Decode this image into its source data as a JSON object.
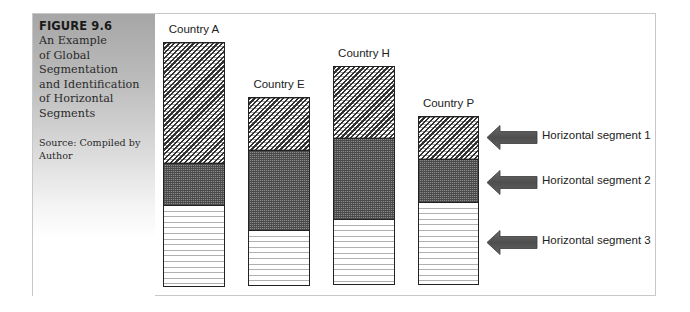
{
  "figure": {
    "number": "FIGURE 9.6",
    "title_lines": [
      "An Example",
      "of Global",
      "Segmentation",
      "and Identification",
      "of Horizontal",
      "Segments"
    ],
    "source_lines": [
      "Source: Compiled by",
      "Author"
    ]
  },
  "colors": {
    "sidebar_top": "#a6a6a6",
    "segment_1_pattern": "#2f2f2f",
    "segment_2_fill": "#6e6e6e",
    "segment_3_lines": "#b0b0b0",
    "arrow_fill": "#5a5a5a",
    "frame_border": "#c8c8c8"
  },
  "chart_data": {
    "type": "bar",
    "stacked": true,
    "title": "An Example of Global Segmentation and Identification of Horizontal Segments",
    "xlabel": "",
    "ylabel": "",
    "categories": [
      "Country A",
      "Country E",
      "Country H",
      "Country P"
    ],
    "series": [
      {
        "name": "Horizontal segment 3",
        "pattern": "horizontal-lines",
        "values": [
          80,
          54,
          64,
          82
        ]
      },
      {
        "name": "Horizontal segment 2",
        "pattern": "dense-dots",
        "values": [
          43,
          81,
          82,
          43
        ]
      },
      {
        "name": "Horizontal segment 1",
        "pattern": "diagonal-zigzag",
        "values": [
          122,
          54,
          73,
          44
        ]
      }
    ],
    "totals": [
      245,
      189,
      219,
      169
    ],
    "units": "relative pixel height (no axis shown)",
    "grid": false,
    "axes_visible": false,
    "legend": {
      "position": "right",
      "style": "left-pointing arrows",
      "entries": [
        "Horizontal segment 1",
        "Horizontal segment 2",
        "Horizontal segment 3"
      ]
    }
  },
  "bars": [
    {
      "label": "Country A",
      "left": 163,
      "top": 42,
      "width": 62,
      "bottom": 287,
      "s1": 122,
      "s2": 43,
      "s3": 80
    },
    {
      "label": "Country E",
      "left": 248,
      "top": 97,
      "width": 62,
      "bottom": 286,
      "s1": 54,
      "s2": 81,
      "s3": 54
    },
    {
      "label": "Country H",
      "left": 333,
      "top": 66,
      "width": 62,
      "bottom": 285,
      "s1": 73,
      "s2": 82,
      "s3": 64
    },
    {
      "label": "Country P",
      "left": 418,
      "top": 116,
      "width": 61,
      "bottom": 285,
      "s1": 44,
      "s2": 43,
      "s3": 82
    }
  ],
  "legend": {
    "items": [
      {
        "label": "Horizontal segment 1"
      },
      {
        "label": "Horizontal segment 2"
      },
      {
        "label": "Horizontal segment 3"
      }
    ]
  }
}
